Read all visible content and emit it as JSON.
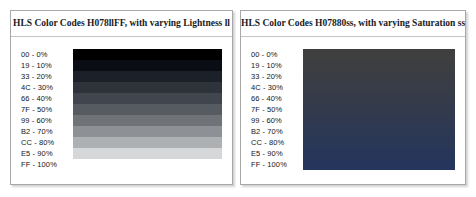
{
  "panels": [
    {
      "id": "lightness-panel",
      "title": "HLS Color Codes H078llFF, with varying Lightness ll",
      "rows": [
        {
          "label": "00 - 0%",
          "hex": "00",
          "percent": "0%",
          "color": "#000000"
        },
        {
          "label": "19 - 10%",
          "hex": "19",
          "percent": "10%",
          "color": "#0a0d14"
        },
        {
          "label": "33 - 20%",
          "hex": "33",
          "percent": "20%",
          "color": "#1c2029"
        },
        {
          "label": "4C - 30%",
          "hex": "4C",
          "percent": "30%",
          "color": "#2e3239"
        },
        {
          "label": "66 - 40%",
          "hex": "66",
          "percent": "40%",
          "color": "#41454d"
        },
        {
          "label": "7F - 50%",
          "hex": "7F",
          "percent": "50%",
          "color": "#565a61"
        },
        {
          "label": "99 - 60%",
          "hex": "99",
          "percent": "60%",
          "color": "#6f7378"
        },
        {
          "label": "B2 - 70%",
          "hex": "B2",
          "percent": "70%",
          "color": "#8d9095"
        },
        {
          "label": "CC - 80%",
          "hex": "CC",
          "percent": "80%",
          "color": "#aeb1b4"
        },
        {
          "label": "E5 - 90%",
          "hex": "E5",
          "percent": "90%",
          "color": "#d5d7d9"
        },
        {
          "label": "FF - 100%",
          "hex": "FF",
          "percent": "100%",
          "color": "#ffffff"
        }
      ]
    },
    {
      "id": "saturation-panel",
      "title": "HLS Color Codes H07880ss, with varying Saturation ss",
      "rows": [
        {
          "label": "00 - 0%",
          "hex": "00",
          "percent": "0%",
          "color": "#3f3f3f"
        },
        {
          "label": "19 - 10%",
          "hex": "19",
          "percent": "10%",
          "color": "#3d3e41"
        },
        {
          "label": "33 - 20%",
          "hex": "33",
          "percent": "20%",
          "color": "#3a3d43"
        },
        {
          "label": "4C - 30%",
          "hex": "4C",
          "percent": "30%",
          "color": "#383c46"
        },
        {
          "label": "66 - 40%",
          "hex": "66",
          "percent": "40%",
          "color": "#353b49"
        },
        {
          "label": "7F - 50%",
          "hex": "7F",
          "percent": "50%",
          "color": "#323a4c"
        },
        {
          "label": "99 - 60%",
          "hex": "99",
          "percent": "60%",
          "color": "#30394f"
        },
        {
          "label": "B2 - 70%",
          "hex": "B2",
          "percent": "70%",
          "color": "#2d3852"
        },
        {
          "label": "CC - 80%",
          "hex": "CC",
          "percent": "80%",
          "color": "#2a3755"
        },
        {
          "label": "E5 - 90%",
          "hex": "E5",
          "percent": "90%",
          "color": "#283659"
        },
        {
          "label": "FF - 100%",
          "hex": "FF",
          "percent": "100%",
          "color": "#25355c"
        }
      ]
    }
  ],
  "chart_data": [
    {
      "type": "heatmap",
      "title": "HLS Color Codes H078llFF, with varying Lightness ll",
      "xlabel": "",
      "ylabel": "",
      "legend_position": "left",
      "grid": false,
      "categories": [
        "00 - 0%",
        "19 - 10%",
        "33 - 20%",
        "4C - 30%",
        "66 - 40%",
        "7F - 50%",
        "99 - 60%",
        "B2 - 70%",
        "CC - 80%",
        "E5 - 90%",
        "FF - 100%"
      ],
      "hex_steps": [
        "00",
        "19",
        "33",
        "4C",
        "66",
        "7F",
        "99",
        "B2",
        "CC",
        "E5",
        "FF"
      ],
      "values": [
        0,
        10,
        20,
        30,
        40,
        50,
        60,
        70,
        80,
        90,
        100
      ],
      "colors": [
        "#000000",
        "#0a0d14",
        "#1c2029",
        "#2e3239",
        "#41454d",
        "#565a61",
        "#6f7378",
        "#8d9095",
        "#aeb1b4",
        "#d5d7d9",
        "#ffffff"
      ],
      "varying_parameter": "Lightness ll"
    },
    {
      "type": "heatmap",
      "title": "HLS Color Codes H07880ss, with varying Saturation ss",
      "xlabel": "",
      "ylabel": "",
      "legend_position": "left",
      "grid": false,
      "categories": [
        "00 - 0%",
        "19 - 10%",
        "33 - 20%",
        "4C - 30%",
        "66 - 40%",
        "7F - 50%",
        "99 - 60%",
        "B2 - 70%",
        "CC - 80%",
        "E5 - 90%",
        "FF - 100%"
      ],
      "hex_steps": [
        "00",
        "19",
        "33",
        "4C",
        "66",
        "7F",
        "99",
        "B2",
        "CC",
        "E5",
        "FF"
      ],
      "values": [
        0,
        10,
        20,
        30,
        40,
        50,
        60,
        70,
        80,
        90,
        100
      ],
      "colors": [
        "#3f3f3f",
        "#3d3e41",
        "#3a3d43",
        "#383c46",
        "#353b49",
        "#323a4c",
        "#30394f",
        "#2d3852",
        "#2a3755",
        "#283659",
        "#25355c"
      ],
      "varying_parameter": "Saturation ss"
    }
  ]
}
